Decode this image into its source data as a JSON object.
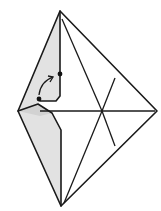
{
  "diagram": {
    "type": "origami-fold-step",
    "colors": {
      "line": "#1a1a1a",
      "shade_light": "#e2e2e2",
      "shade_dark": "#d2d2d2",
      "background": "#ffffff"
    },
    "markers": [
      {
        "name": "start-point",
        "label": ""
      },
      {
        "name": "target-point",
        "label": ""
      }
    ],
    "arrow": {
      "kind": "curved-fold-arrow",
      "direction": "up-right"
    }
  }
}
